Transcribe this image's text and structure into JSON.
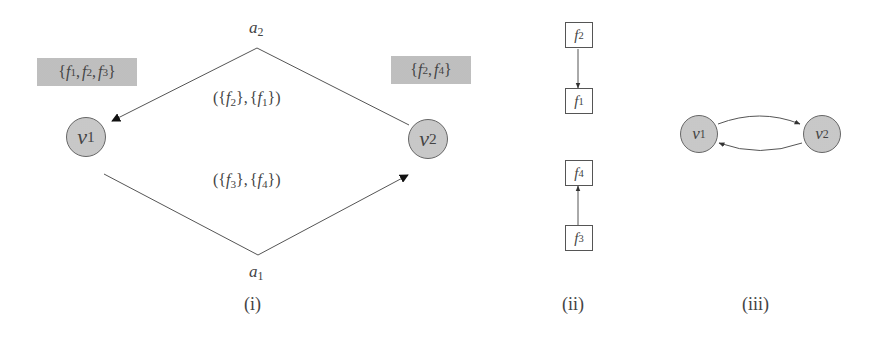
{
  "panels": {
    "i": {
      "caption": "(i)",
      "nodes": [
        {
          "id": "v1",
          "base": "v",
          "sub": "1"
        },
        {
          "id": "v2",
          "base": "v",
          "sub": "2"
        }
      ],
      "node_sets": {
        "v1": {
          "text": "{f1, f2, f3}",
          "parts": [
            {
              "b": "f",
              "s": "1"
            },
            {
              "b": "f",
              "s": "2"
            },
            {
              "b": "f",
              "s": "3"
            }
          ]
        },
        "v2": {
          "text": "{f2, f4}",
          "parts": [
            {
              "b": "f",
              "s": "2"
            },
            {
              "b": "f",
              "s": "4"
            }
          ]
        }
      },
      "arcs": [
        {
          "id": "a2",
          "base": "a",
          "sub": "2",
          "from": "v2",
          "to": "v1",
          "label": "({f2}, {f1})",
          "label_parts": {
            "left": {
              "b": "f",
              "s": "2"
            },
            "right": {
              "b": "f",
              "s": "1"
            }
          }
        },
        {
          "id": "a1",
          "base": "a",
          "sub": "1",
          "from": "v1",
          "to": "v2",
          "label": "({f3}, {f4})",
          "label_parts": {
            "left": {
              "b": "f",
              "s": "3"
            },
            "right": {
              "b": "f",
              "s": "4"
            }
          }
        }
      ]
    },
    "ii": {
      "caption": "(ii)",
      "boxes": [
        {
          "id": "f2",
          "base": "f",
          "sub": "2"
        },
        {
          "id": "f1",
          "base": "f",
          "sub": "1"
        },
        {
          "id": "f4",
          "base": "f",
          "sub": "4"
        },
        {
          "id": "f3",
          "base": "f",
          "sub": "3"
        }
      ],
      "edges": [
        {
          "from": "f2",
          "to": "f1"
        },
        {
          "from": "f3",
          "to": "f4"
        }
      ]
    },
    "iii": {
      "caption": "(iii)",
      "nodes": [
        {
          "id": "v1",
          "base": "v",
          "sub": "1"
        },
        {
          "id": "v2",
          "base": "v",
          "sub": "2"
        }
      ],
      "edges": [
        {
          "from": "v1",
          "to": "v2"
        },
        {
          "from": "v2",
          "to": "v1"
        }
      ]
    }
  },
  "symbols": {
    "open_brace": "{",
    "close_brace": "}",
    "comma": ",",
    "open_paren": "(",
    "close_paren": ")"
  }
}
